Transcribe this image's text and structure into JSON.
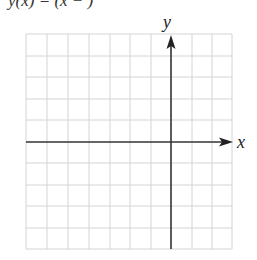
{
  "caption": "y(x) = (x − ) ",
  "axes": {
    "x_label": "x",
    "y_label": "y"
  },
  "grid": {
    "columns": 10,
    "rows": 10,
    "y_axis_column_index": 7,
    "x_axis_row_index": 5,
    "grid_color": "#d4d4d4",
    "axis_color": "#333333"
  }
}
